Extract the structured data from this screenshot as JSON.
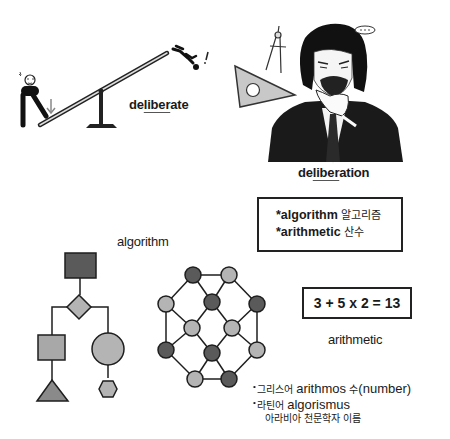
{
  "seesaw_scene": {
    "word_prefix": "de",
    "word_root": "liber",
    "word_suffix": "ate",
    "icons": [
      "standing-person-icon",
      "down-arrow-icon",
      "seesaw-icon",
      "falling-person-icon",
      "exclamation-icon"
    ]
  },
  "thinking_scene": {
    "word_prefix": "de",
    "word_root": "liber",
    "word_suffix": "ation",
    "icons": [
      "compass-icon",
      "set-square-icon",
      "thinking-man-illustration",
      "speech-bubble-icon"
    ]
  },
  "terms_box": {
    "line1_en": "*algorithm",
    "line1_kr": "알고리즘",
    "line2_en": "*arithmetic",
    "line2_kr": "산수"
  },
  "algorithm_section": {
    "label": "algorithm",
    "flowchart_shapes": [
      "square",
      "diamond",
      "square",
      "circle",
      "triangle",
      "hexagon"
    ],
    "graph_nodes": 12
  },
  "arithmetic_section": {
    "equation": "3 + 5 x 2 = 13",
    "label": "arithmetic"
  },
  "etymology": {
    "bullet": "•",
    "line1_kr": "그리스어",
    "line1_en": "arithmos",
    "line1_kr2": "수",
    "line1_en2": "(number)",
    "line2_kr": "라틴어",
    "line2_en": "algorismus",
    "line3_kr": "아라비아 천문학자 이름"
  },
  "colors": {
    "dark_node": "#5a5a5a",
    "light_node": "#b4b4b4",
    "mid_node": "#a0a0a0",
    "stroke": "#1e1e1e"
  }
}
